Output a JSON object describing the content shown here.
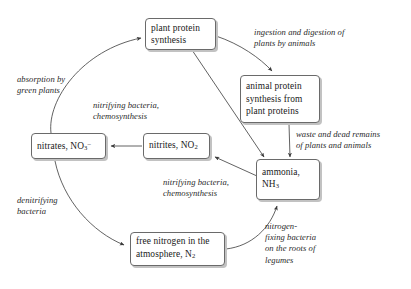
{
  "diagram": {
    "colors": {
      "node_border": "#6a6a6a",
      "node_shadow": "#c2c2c2",
      "edge": "#3a3a3a",
      "text": "#1a1a1a",
      "label_text": "#2a2a2a",
      "background": "#ffffff"
    },
    "nodes": [
      {
        "id": "plant-protein-synthesis",
        "lines": [
          "plant protein",
          "synthesis"
        ]
      },
      {
        "id": "animal-protein-synthesis",
        "lines": [
          "animal protein",
          "synthesis from",
          "plant proteins"
        ]
      },
      {
        "id": "ammonia",
        "lines": [
          "ammonia,",
          "NH3"
        ],
        "formula": "NH",
        "formula_sub": "3"
      },
      {
        "id": "nitrites",
        "lines": [
          "nitrites, NO2"
        ],
        "prefix": "nitrites, NO",
        "sub": "2"
      },
      {
        "id": "nitrates",
        "lines": [
          "nitrates, NO3-"
        ],
        "prefix": "nitrates, NO",
        "sub": "3",
        "sup": "–"
      },
      {
        "id": "free-nitrogen",
        "lines": [
          "free nitrogen in the",
          "atmosphere, N2"
        ],
        "prefix": "atmosphere, N",
        "sub": "2"
      }
    ],
    "edge_labels": [
      {
        "id": "ingestion-digestion",
        "lines": [
          "ingestion and digestion of",
          "plants by animals"
        ]
      },
      {
        "id": "absorption-green-plants",
        "lines": [
          "absorption by",
          "green plants"
        ]
      },
      {
        "id": "nitrifying-upper",
        "lines": [
          "nitrifying bacteria,",
          "chemosynthesis"
        ]
      },
      {
        "id": "waste-dead-remains",
        "lines": [
          "waste and dead remains",
          "of plants and animals"
        ]
      },
      {
        "id": "nitrifying-lower",
        "lines": [
          "nitrifying bacteria,",
          "chemosynthesis"
        ]
      },
      {
        "id": "denitrifying",
        "lines": [
          "denitrifying",
          "bacteria"
        ]
      },
      {
        "id": "nitrogen-fixing",
        "lines": [
          "nitrogen-",
          "fixing bacteria",
          "on the roots of",
          "legumes"
        ]
      }
    ]
  }
}
